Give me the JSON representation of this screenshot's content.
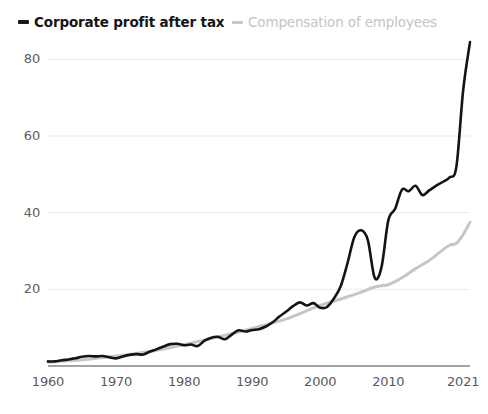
{
  "legend": {
    "position": "top-left",
    "items": [
      {
        "label": "Corporate profit after tax",
        "color": "#151515",
        "marker": "dash"
      },
      {
        "label": "Compensation of employees",
        "color": "#c4c4c4",
        "marker": "dash"
      }
    ]
  },
  "chart_data": {
    "type": "line",
    "title": "",
    "subtitle": "",
    "xlabel": "",
    "ylabel": "",
    "xlim": [
      1960,
      2022
    ],
    "ylim": [
      0,
      88
    ],
    "grid": "horizontal",
    "legend_position": "top-left",
    "x_tick_labels": [
      "1960",
      "1970",
      "1980",
      "1990",
      "2000",
      "2010",
      "2021"
    ],
    "x_ticks": [
      1960,
      1970,
      1980,
      1990,
      2000,
      2010,
      2021
    ],
    "y_tick_labels": [
      "20",
      "40",
      "60",
      "80"
    ],
    "y_ticks": [
      20,
      40,
      60,
      80
    ],
    "series": [
      {
        "name": "Corporate profit after tax",
        "color": "#141414",
        "width": 2.6,
        "x": [
          1960,
          1961,
          1962,
          1963,
          1964,
          1965,
          1966,
          1967,
          1968,
          1969,
          1970,
          1971,
          1972,
          1973,
          1974,
          1975,
          1976,
          1977,
          1978,
          1979,
          1980,
          1981,
          1982,
          1983,
          1984,
          1985,
          1986,
          1987,
          1988,
          1989,
          1990,
          1991,
          1992,
          1993,
          1994,
          1995,
          1996,
          1997,
          1998,
          1999,
          2000,
          2001,
          2002,
          2003,
          2004,
          2005,
          2006,
          2007,
          2008,
          2009,
          2010,
          2011,
          2012,
          2013,
          2014,
          2015,
          2016,
          2017,
          2018,
          2019,
          2020,
          2021,
          2022
        ],
        "values": [
          1.2,
          1.2,
          1.5,
          1.7,
          2.0,
          2.4,
          2.6,
          2.5,
          2.6,
          2.3,
          2.0,
          2.5,
          2.9,
          3.1,
          3.0,
          3.8,
          4.4,
          5.1,
          5.7,
          5.8,
          5.4,
          5.6,
          5.2,
          6.6,
          7.4,
          7.6,
          7.0,
          8.2,
          9.3,
          9.0,
          9.4,
          9.6,
          10.3,
          11.4,
          12.9,
          14.2,
          15.6,
          16.6,
          15.8,
          16.4,
          15.2,
          15.4,
          17.6,
          20.8,
          26.8,
          33.6,
          35.4,
          32.8,
          23.0,
          25.8,
          38.0,
          41.0,
          46.0,
          45.6,
          47.0,
          44.6,
          45.8,
          47.0,
          48.0,
          49.2,
          52.0,
          72.0,
          84.5
        ]
      },
      {
        "name": "Compensation of employees",
        "color": "#c6c6c6",
        "width": 3.0,
        "x": [
          1960,
          1965,
          1970,
          1975,
          1980,
          1985,
          1990,
          1995,
          2000,
          2005,
          2008,
          2010,
          2012,
          2014,
          2016,
          2018,
          2019,
          2020,
          2021,
          2022
        ],
        "values": [
          1.0,
          1.6,
          2.6,
          3.8,
          5.6,
          7.6,
          9.8,
          12.3,
          15.8,
          18.6,
          20.6,
          21.2,
          23.0,
          25.4,
          27.5,
          30.3,
          31.5,
          32.0,
          34.3,
          37.5
        ]
      }
    ]
  },
  "axis": {
    "baseline_color": "#4a4a4a",
    "gridline_color": "#ebebeb",
    "tick_text_color": "#5c5c5c"
  }
}
